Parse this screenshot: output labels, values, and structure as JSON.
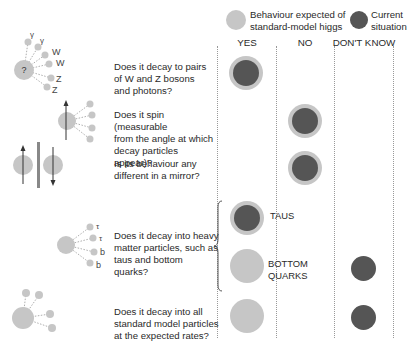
{
  "legend": {
    "expected_label": "Behaviour expected of standard-model higgs",
    "expected_line1": "Behaviour expected of",
    "expected_line2": "standard-model higgs",
    "current_label": "Current situation",
    "current_line1": "Current",
    "current_line2": "situation",
    "colors": {
      "expected": "#c6c6c6",
      "current": "#555555"
    }
  },
  "columns": [
    "YES",
    "NO",
    "DON'T KNOW"
  ],
  "rows": [
    {
      "question": "Does it decay to pairs of W and Z bosons and photons?",
      "lines": [
        "Does it decay to pairs",
        "of W and Z bosons",
        "and photons?"
      ],
      "expected": "YES",
      "current": "YES",
      "illustration_labels": [
        "γ",
        "γ",
        "W",
        "W",
        "Z",
        "Z",
        "?"
      ]
    },
    {
      "question": "Does it spin (measurable from the angle at which decay particles appear)?",
      "lines": [
        "Does it spin (measurable",
        "from the angle at which",
        "decay particles appear)?"
      ],
      "expected": "NO",
      "current": "NO"
    },
    {
      "question": "Is its behaviour any different in a mirror?",
      "lines": [
        "Is its behaviour any",
        "different in a mirror?"
      ],
      "expected": "NO",
      "current": "NO"
    },
    {
      "question": "Does it decay into heavy matter particles, such as taus and bottom quarks?",
      "lines": [
        "Does it decay into heavy",
        "matter particles, such as",
        "taus and bottom quarks?"
      ],
      "illustration_labels": [
        "τ",
        "τ",
        "b",
        "b"
      ],
      "sub_rows": [
        {
          "label": "TAUS",
          "expected": "YES",
          "current": "YES"
        },
        {
          "label": "BOTTOM QUARKS",
          "label_line1": "BOTTOM",
          "label_line2": "QUARKS",
          "expected": "YES",
          "current": "DON'T KNOW"
        }
      ]
    },
    {
      "question": "Does it decay into all standard model particles at the expected rates?",
      "lines": [
        "Does it decay into all",
        "standard model particles",
        "at the expected rates?"
      ],
      "expected": "YES",
      "current": "DON'T KNOW"
    }
  ]
}
